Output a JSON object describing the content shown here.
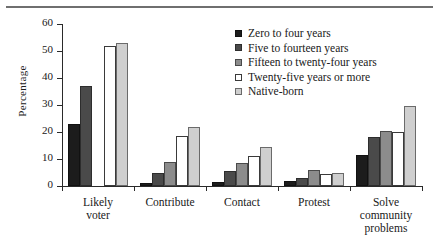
{
  "chart_data": {
    "type": "bar",
    "title": "",
    "xlabel": "",
    "ylabel": "Percentage",
    "ylim": [
      0,
      60
    ],
    "yticks": [
      0,
      10,
      20,
      30,
      40,
      50,
      60
    ],
    "grid": false,
    "legend_position": "top-right",
    "categories": [
      "Likely voter",
      "Contribute",
      "Contact",
      "Protest",
      "Solve community problems"
    ],
    "category_lines": [
      [
        "Likely",
        "voter"
      ],
      [
        "Contribute"
      ],
      [
        "Contact"
      ],
      [
        "Protest"
      ],
      [
        "Solve",
        "community",
        "problems"
      ]
    ],
    "series": [
      {
        "name": "Zero to four years",
        "color": "#1c1c1c",
        "values": [
          23,
          1,
          1.5,
          2,
          11.5
        ]
      },
      {
        "name": "Five to fourteen years",
        "color": "#4a4a4a",
        "values": [
          37,
          5,
          5.5,
          3,
          18
        ]
      },
      {
        "name": "Fifteen to twenty-four years",
        "color": "#8c8c8c",
        "values": [
          0,
          9,
          8.5,
          6,
          20.5
        ]
      },
      {
        "name": "Twenty-five years or more",
        "color": "#ffffff",
        "values": [
          52,
          18.5,
          11,
          4.5,
          20
        ]
      },
      {
        "name": "Native-born",
        "color": "#cfcfcf",
        "values": [
          53,
          22,
          14.5,
          5,
          29.5
        ]
      }
    ]
  }
}
